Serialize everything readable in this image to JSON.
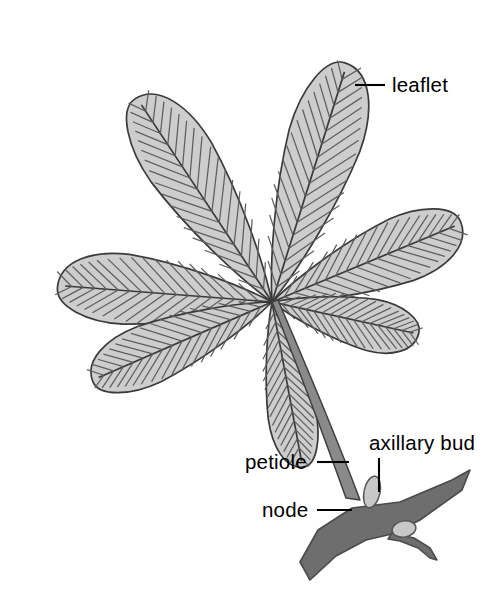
{
  "figure": {
    "background_color": "#ffffff"
  },
  "colors": {
    "leaflet_fill": "#cdcdcd",
    "leaflet_outline": "#3a3a3a",
    "vein_color": "#5e5e5e",
    "petiole_fill": "#8a8a8a",
    "petiole_outline": "#3f3f3f",
    "stem_fill": "#6e6e6e",
    "stem_outline": "#4a4a4a",
    "bud_fill": "#c8c8c8",
    "bud_outline": "#555555",
    "label_color": "#000000",
    "leader_color": "#000000"
  },
  "labels": [
    {
      "id": "leaflet",
      "text": "leaflet",
      "text_x": 392,
      "text_y": 92,
      "anchor": "start",
      "leader": {
        "x1": 355,
        "y1": 85,
        "x2": 385,
        "y2": 85
      }
    },
    {
      "id": "axillary-bud",
      "text": "axillary bud",
      "text_x": 369,
      "text_y": 450,
      "anchor": "start",
      "leader": {
        "x1": 379,
        "y1": 458,
        "x2": 379,
        "y2": 492
      }
    },
    {
      "id": "petiole",
      "text": "petiole",
      "text_x": 245,
      "text_y": 469,
      "anchor": "start",
      "leader": {
        "x1": 317,
        "y1": 462,
        "x2": 349,
        "y2": 462
      }
    },
    {
      "id": "node",
      "text": "node",
      "text_x": 262,
      "text_y": 517,
      "anchor": "start",
      "leader": {
        "x1": 317,
        "y1": 510,
        "x2": 352,
        "y2": 510
      }
    }
  ],
  "structure": {
    "attachment_point": {
      "x": 272,
      "y": 302
    },
    "leaflet_count": 7,
    "leaflets": [
      {
        "id": "leaflet-upper-right",
        "angle_deg": -72,
        "length": 250,
        "width": 74
      },
      {
        "id": "leaflet-upper-left",
        "angle_deg": -123,
        "length": 245,
        "width": 72
      },
      {
        "id": "leaflet-left",
        "angle_deg": -175,
        "length": 215,
        "width": 70
      },
      {
        "id": "leaflet-right",
        "angle_deg": -22,
        "length": 205,
        "width": 66
      },
      {
        "id": "leaflet-lower-left",
        "angle_deg": 157,
        "length": 196,
        "width": 60
      },
      {
        "id": "leaflet-lower-right",
        "angle_deg": 13,
        "length": 150,
        "width": 52
      },
      {
        "id": "leaflet-bottom",
        "angle_deg": 80,
        "length": 168,
        "width": 48
      }
    ],
    "petiole": {
      "from": {
        "x": 272,
        "y": 302
      },
      "to": {
        "x": 356,
        "y": 506
      }
    },
    "node": {
      "x": 358,
      "y": 508
    },
    "buds": [
      {
        "id": "axillary-bud-upper",
        "x": 372,
        "y": 492,
        "rx": 8,
        "ry": 16,
        "rotate": 12
      },
      {
        "id": "axillary-bud-lower",
        "x": 404,
        "y": 530,
        "rx": 11,
        "ry": 8,
        "rotate": -8
      }
    ]
  },
  "chart_data": {
    "type": "diagram",
    "parts": [
      {
        "name": "leaflet",
        "description": "One of seven obovate blades radiating from a common point"
      },
      {
        "name": "petiole",
        "description": "Curved stalk joining the leaflets to the stem"
      },
      {
        "name": "node",
        "description": "Point on the stem where the petiole attaches"
      },
      {
        "name": "axillary bud",
        "description": "Small bud in the axil between petiole and stem"
      }
    ]
  }
}
